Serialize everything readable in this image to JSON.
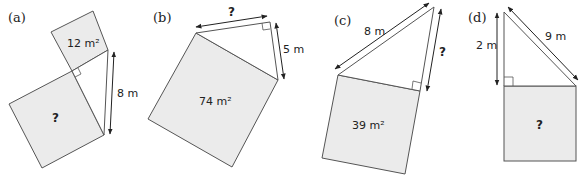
{
  "figure": {
    "panels": [
      {
        "id": "a",
        "label": "(a)",
        "small_square_area": "12 m²",
        "large_square_area": "?",
        "side_length": "8 m"
      },
      {
        "id": "b",
        "label": "(b)",
        "square_area": "74 m²",
        "hypotenuse_leg": "?",
        "side_length": "5 m"
      },
      {
        "id": "c",
        "label": "(c)",
        "square_area": "39 m²",
        "hypotenuse": "8 m",
        "unknown_leg": "?"
      },
      {
        "id": "d",
        "label": "(d)",
        "square_area": "?",
        "leg": "2 m",
        "hypotenuse": "9 m"
      }
    ],
    "colors": {
      "square_fill": "#ebebeb",
      "stroke": "#555555",
      "text": "#222222"
    }
  }
}
